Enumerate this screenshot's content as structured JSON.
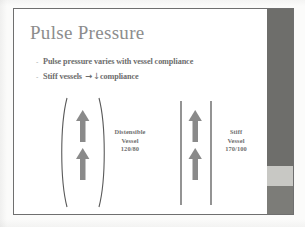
{
  "slide": {
    "title": "Pulse Pressure",
    "bullets": [
      {
        "marker": "-",
        "text": "Pulse pressure varies with vessel compliance"
      }
    ],
    "bullet_two": {
      "marker": "-",
      "prefix": "Stiff vessels ",
      "arrow": "→",
      "down_arrow": "↓",
      "suffix": "compliance"
    },
    "diagram": {
      "left_vessel": {
        "name": "distensible-vessel",
        "shape": "curved-bulging-walls",
        "arrow_count": 2,
        "label_line1": "Distensible",
        "label_line2": "Vessel",
        "label_line3": "120/80"
      },
      "right_vessel": {
        "name": "stiff-vessel",
        "shape": "straight-parallel-walls",
        "arrow_count": 2,
        "label_line1": "Stiff",
        "label_line2": "Vessel",
        "label_line3": "170/100"
      }
    },
    "colors": {
      "title_gray": "#8d8d8d",
      "body_gray": "#6d6d6d",
      "arrow_gray": "#8a8a8a",
      "vessel_wall": "#5a5a5a",
      "sidebar_dark": "#6e6e6b",
      "sidebar_light": "#c8c8c4",
      "page_background": "#fbfbfa",
      "frame_border": "#6f6f6f"
    }
  }
}
